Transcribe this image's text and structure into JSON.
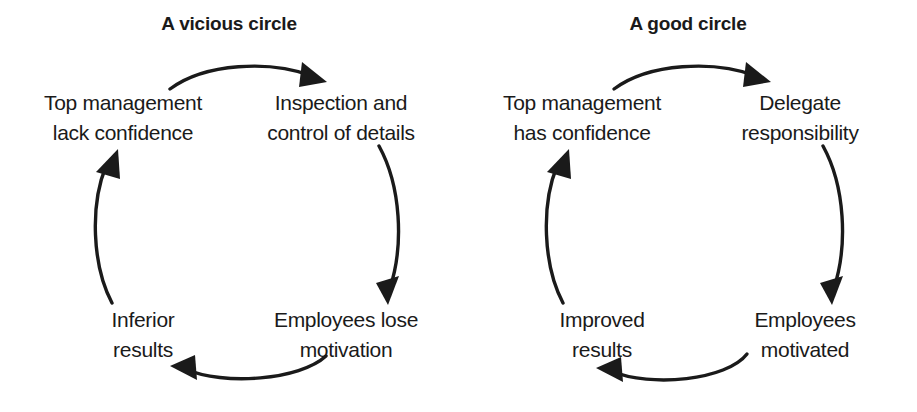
{
  "page": {
    "background_color": "#ffffff",
    "ink_color": "#1a1a1a"
  },
  "diagrams": [
    {
      "id": "vicious-circle",
      "title": "A vicious circle",
      "nodes": {
        "top_left": {
          "line1": "Top management",
          "line2": "lack confidence"
        },
        "top_right": {
          "line1": "Inspection and",
          "line2": "control of details"
        },
        "bottom_right": {
          "line1": "Employees lose",
          "line2": "motivation"
        },
        "bottom_left": {
          "line1": "Inferior",
          "line2": "results"
        }
      },
      "arrows": [
        {
          "name": "arrow-top",
          "from": "Top management lack confidence",
          "to": "Inspection and control of details",
          "direction": "clockwise"
        },
        {
          "name": "arrow-right",
          "from": "Inspection and control of details",
          "to": "Employees lose motivation",
          "direction": "clockwise"
        },
        {
          "name": "arrow-bottom",
          "from": "Employees lose motivation",
          "to": "Inferior results",
          "direction": "clockwise"
        },
        {
          "name": "arrow-left",
          "from": "Inferior results",
          "to": "Top management lack confidence",
          "direction": "clockwise"
        }
      ]
    },
    {
      "id": "good-circle",
      "title": "A good circle",
      "nodes": {
        "top_left": {
          "line1": "Top management",
          "line2": "has confidence"
        },
        "top_right": {
          "line1": "Delegate",
          "line2": "responsibility"
        },
        "bottom_right": {
          "line1": "Employees",
          "line2": "motivated"
        },
        "bottom_left": {
          "line1": "Improved",
          "line2": "results"
        }
      },
      "arrows": [
        {
          "name": "arrow-top",
          "from": "Top management has confidence",
          "to": "Delegate responsibility",
          "direction": "clockwise"
        },
        {
          "name": "arrow-right",
          "from": "Delegate responsibility",
          "to": "Employees motivated",
          "direction": "clockwise"
        },
        {
          "name": "arrow-bottom",
          "from": "Employees motivated",
          "to": "Improved results",
          "direction": "clockwise"
        },
        {
          "name": "arrow-left",
          "from": "Improved results",
          "to": "Top management has confidence",
          "direction": "clockwise"
        }
      ]
    }
  ]
}
